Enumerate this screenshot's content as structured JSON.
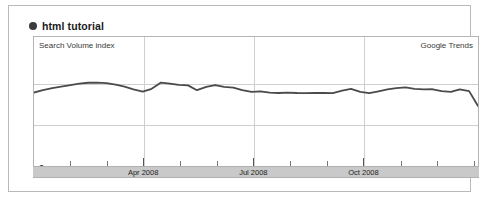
{
  "header": {
    "legend_dot_color": "#3b3b3b",
    "title": "html tutorial"
  },
  "plot": {
    "y_axis_label": "Search Volume index",
    "brand_label": "Google Trends",
    "zero_label": "0"
  },
  "chart_data": {
    "type": "line",
    "title": "html tutorial",
    "xlabel": "",
    "ylabel": "Search Volume index",
    "source": "Google Trends",
    "grid": true,
    "legend": "top-left",
    "ylim": [
      0,
      1.5
    ],
    "y_gridlines": [
      0.5,
      1.0
    ],
    "axis_tick_labels": [
      "Apr 2008",
      "Jul 2008",
      "Oct 2008"
    ],
    "axis_tick_positions": [
      0.247,
      0.494,
      0.741
    ],
    "minor_tick_positions": [
      0.082,
      0.165,
      0.329,
      0.412,
      0.576,
      0.659,
      0.824,
      0.906,
      0.988
    ],
    "series": [
      {
        "name": "html tutorial",
        "color": "#4a4a4a",
        "x": [
          0.0,
          0.02,
          0.041,
          0.061,
          0.082,
          0.102,
          0.122,
          0.143,
          0.163,
          0.184,
          0.204,
          0.224,
          0.245,
          0.265,
          0.286,
          0.306,
          0.326,
          0.347,
          0.367,
          0.388,
          0.408,
          0.428,
          0.449,
          0.469,
          0.49,
          0.51,
          0.531,
          0.551,
          0.571,
          0.592,
          0.612,
          0.633,
          0.653,
          0.673,
          0.694,
          0.714,
          0.735,
          0.755,
          0.776,
          0.796,
          0.816,
          0.837,
          0.857,
          0.878,
          0.898,
          0.918,
          0.939,
          0.959,
          0.98,
          1.0
        ],
        "values": [
          0.905,
          0.93,
          0.952,
          0.968,
          0.985,
          1.0,
          1.01,
          1.012,
          1.005,
          0.99,
          0.968,
          0.94,
          0.915,
          0.945,
          1.012,
          1.0,
          0.988,
          0.982,
          0.93,
          0.965,
          0.985,
          0.965,
          0.958,
          0.93,
          0.912,
          0.918,
          0.905,
          0.9,
          0.905,
          0.9,
          0.898,
          0.9,
          0.9,
          0.898,
          0.925,
          0.945,
          0.912,
          0.898,
          0.918,
          0.938,
          0.952,
          0.96,
          0.945,
          0.938,
          0.94,
          0.92,
          0.912,
          0.938,
          0.92,
          0.76
        ]
      }
    ]
  },
  "months": [
    {
      "label": "Apr 2008",
      "position": 0.247
    },
    {
      "label": "Jul 2008",
      "position": 0.494
    },
    {
      "label": "Oct 2008",
      "position": 0.741
    }
  ]
}
